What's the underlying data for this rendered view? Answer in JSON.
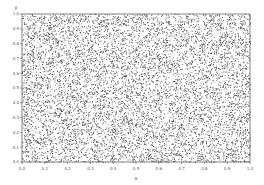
{
  "chart_data": {
    "type": "scatter",
    "title": "",
    "xlabel": "x",
    "ylabel": "y",
    "xlim": [
      0.0,
      1.0
    ],
    "ylim": [
      0.0,
      1.0
    ],
    "grid": false,
    "legend": null,
    "x_ticks": [
      "0.0",
      "0.1",
      "0.2",
      "0.3",
      "0.4",
      "0.5",
      "0.6",
      "0.7",
      "0.8",
      "0.9",
      "1.0"
    ],
    "y_ticks": [
      "0.0",
      "0.1",
      "0.2",
      "0.3",
      "0.4",
      "0.5",
      "0.6",
      "0.7",
      "0.8",
      "0.9",
      "1.0"
    ],
    "series": [
      {
        "name": "points",
        "distribution": "uniform random in [0,1] x [0,1]",
        "approx_count": 10000,
        "marker": "small dot",
        "color": "#222222"
      }
    ]
  },
  "colors": {
    "background": "#ffffff",
    "frame": "#333333",
    "points": "#222222"
  }
}
